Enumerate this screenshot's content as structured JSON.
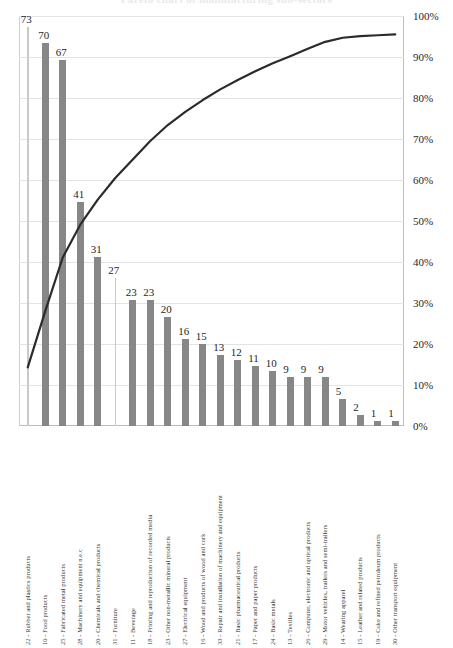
{
  "chart_data": {
    "type": "bar",
    "title": "Pareto chart of manufacturing sub-sectors",
    "xlabel": "",
    "ylabel": "",
    "y2label": "",
    "ylim": [
      0,
      75
    ],
    "y2lim": [
      0,
      100
    ],
    "grid": true,
    "legend": "none",
    "series": [
      {
        "name": "Count",
        "kind": "bar",
        "color": "#878787",
        "values": [
          73,
          70,
          67,
          41,
          31,
          27,
          23,
          23,
          20,
          16,
          15,
          13,
          12,
          11,
          10,
          9,
          9,
          9,
          5,
          2,
          1,
          1
        ]
      },
      {
        "name": "Cumulative %",
        "kind": "line",
        "color": "#2b2b2b",
        "values": [
          14.3,
          28.0,
          41.1,
          49.1,
          55.2,
          60.5,
          65.0,
          69.5,
          73.4,
          76.6,
          79.5,
          82.1,
          84.4,
          86.5,
          88.5,
          90.2,
          92.0,
          93.7,
          94.7,
          95.1,
          95.3,
          95.5
        ]
      }
    ],
    "categories": [
      "22 - Rubber and plastics products",
      "10 - Food products",
      "25 - Fabricated metal products",
      "28 - Machinery and equipment n.e.c",
      "20 - Chemicals and chemical products",
      "31 - Furniture",
      "11 - Beverage",
      "18 - Printing and reproduction of recorded media",
      "23 - Other non-metallic mineral products",
      "27 - Electrical equipment",
      "16 - Wood and products of wood and cork",
      "33 - Repair and installation of machinery and equipment",
      "21 - Basic pharmaceutical products",
      "17 - Paper and paper products",
      "24 - Basic metals",
      "13 - Textiles",
      "26 - Computer, electronic and optical products",
      "29 - Motor vehicles, trailers and semi-trailers",
      "14 - Wearing apparel",
      "15 - Leather and related products",
      "19 - Coke and refined petroleum products",
      "30 - Other transport equipment"
    ],
    "y2_ticks": [
      "100%",
      "90%",
      "80%",
      "70%",
      "60%",
      "50%",
      "40%",
      "30%",
      "20%",
      "10%",
      "0%"
    ],
    "y2_tick_values": [
      100,
      90,
      80,
      70,
      60,
      50,
      40,
      30,
      20,
      10,
      0
    ],
    "colors": {
      "bar": "#878787",
      "bar_thin": "#c9c9c9",
      "line": "#2b2b2b",
      "grid": "#e3e3e3",
      "axis": "#bdbdbd",
      "text": "#1f1f1f"
    }
  }
}
